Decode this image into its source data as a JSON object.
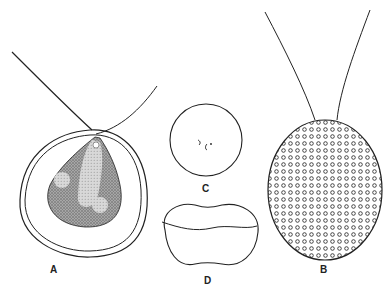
{
  "figure": {
    "panels": [
      {
        "id": "A",
        "label": "A",
        "description": "Flagellate cell within double-walled lorica, stippled protoplast with pyrenoids"
      },
      {
        "id": "B",
        "label": "B",
        "description": "Biflagellate cell with surface covered in small circular scales"
      },
      {
        "id": "C",
        "label": "C",
        "description": "Spherical cyst with small internal marks"
      },
      {
        "id": "D",
        "label": "D",
        "description": "Dividing cell, constricted in the middle"
      }
    ],
    "colors": {
      "ink": "#222222",
      "stipple": "#9a9a9a",
      "background": "#ffffff"
    }
  }
}
